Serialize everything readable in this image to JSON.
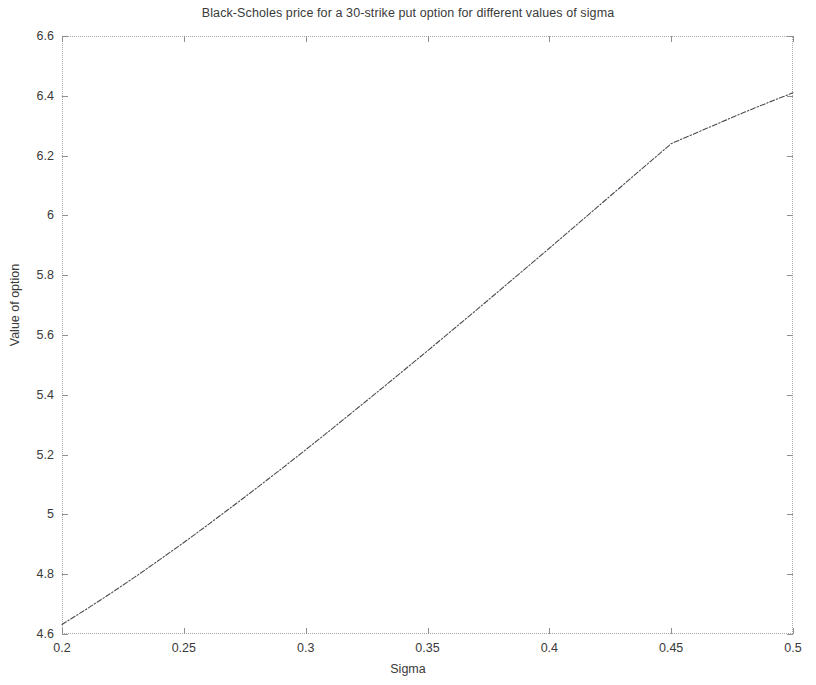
{
  "figure": {
    "background_color": "#ffffff",
    "axis_color": "#a8a8a8",
    "text_color": "#3a3a3a"
  },
  "chart_data": {
    "type": "line",
    "title": "Black-Scholes price for a 30-strike put option for different values of sigma",
    "xlabel": "Sigma",
    "ylabel": "Value of option",
    "xlim": [
      0.2,
      0.5
    ],
    "ylim": [
      4.6,
      6.6
    ],
    "grid": false,
    "legend": null,
    "line_color": "#4a4a52",
    "line_style": "dash-dot",
    "xticks": [
      0.2,
      0.25,
      0.3,
      0.35,
      0.4,
      0.45,
      0.5
    ],
    "xticklabels": [
      "0.2",
      "0.25",
      "0.3",
      "0.35",
      "0.4",
      "0.45",
      "0.5"
    ],
    "yticks": [
      4.6,
      4.8,
      5,
      5.2,
      5.4,
      5.6,
      5.8,
      6,
      6.2,
      6.4,
      6.6
    ],
    "yticklabels": [
      "4.6",
      "4.8",
      "5",
      "5.2",
      "5.4",
      "5.6",
      "5.8",
      "6",
      "6.2",
      "6.4",
      "6.6"
    ],
    "series": [
      {
        "name": "Black-Scholes put price",
        "x": [
          0.2,
          0.21,
          0.22,
          0.23,
          0.24,
          0.25,
          0.26,
          0.27,
          0.28,
          0.29,
          0.3,
          0.31,
          0.32,
          0.33,
          0.34,
          0.35,
          0.36,
          0.37,
          0.38,
          0.39,
          0.4,
          0.41,
          0.42,
          0.43,
          0.44,
          0.45,
          0.46,
          0.47,
          0.48,
          0.49,
          0.5
        ],
        "y": [
          4.632,
          4.683,
          4.736,
          4.791,
          4.848,
          4.906,
          4.966,
          5.027,
          5.089,
          5.152,
          5.216,
          5.281,
          5.347,
          5.413,
          5.48,
          5.547,
          5.615,
          5.683,
          5.752,
          5.821,
          5.89,
          5.96,
          6.03,
          6.1,
          6.17,
          6.24,
          6.275,
          6.31,
          6.345,
          6.378,
          6.41
        ]
      }
    ]
  }
}
